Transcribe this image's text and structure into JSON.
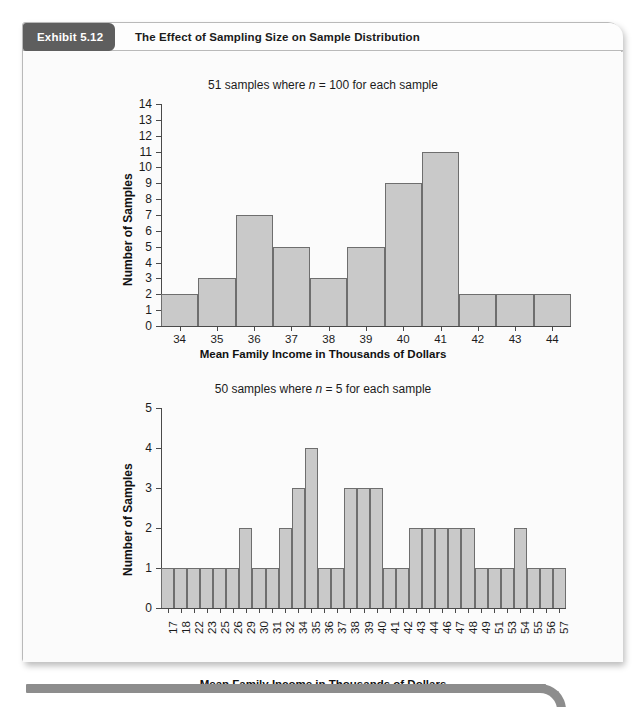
{
  "exhibit": {
    "tab_label": "Exhibit 5.12",
    "title": "The Effect of Sampling Size on Sample Distribution"
  },
  "colors": {
    "tab_background": "#5e5e5e",
    "bar_fill": "#c9c9c9",
    "bar_stroke": "#6e6e6e",
    "axis": "#4a4a4a",
    "card_background": "#fbfbfb",
    "rule": "#8d8d8d"
  },
  "chart_data": [
    {
      "id": "chart-top",
      "type": "bar",
      "title": "51 samples where n = 100 for each sample",
      "title_plain": "51 samples where ",
      "title_italic": "n",
      "title_rest": " = 100 for each sample",
      "xlabel": "Mean Family Income in Thousands of Dollars",
      "ylabel": "Number of Samples",
      "categories": [
        "34",
        "35",
        "36",
        "37",
        "38",
        "39",
        "40",
        "41",
        "42",
        "43",
        "44"
      ],
      "values": [
        2,
        3,
        7,
        5,
        3,
        5,
        9,
        11,
        2,
        2,
        2
      ],
      "ylim": [
        0,
        14
      ],
      "yticks": [
        0,
        1,
        2,
        3,
        4,
        5,
        6,
        7,
        8,
        9,
        10,
        11,
        12,
        13,
        14
      ],
      "grid": false,
      "legend": "none"
    },
    {
      "id": "chart-bottom",
      "type": "bar",
      "title": "50 samples where n = 5 for each sample",
      "title_plain": "50 samples where ",
      "title_italic": "n",
      "title_rest": " = 5 for each sample",
      "xlabel": "Mean Family Income in Thousands of Dollars",
      "ylabel": "Number of Samples",
      "categories": [
        "17",
        "18",
        "22",
        "23",
        "25",
        "26",
        "29",
        "30",
        "31",
        "32",
        "34",
        "35",
        "36",
        "37",
        "38",
        "39",
        "40",
        "41",
        "42",
        "43",
        "44",
        "46",
        "47",
        "48",
        "49",
        "51",
        "53",
        "54",
        "55",
        "56",
        "57"
      ],
      "values": [
        1,
        1,
        1,
        1,
        1,
        1,
        2,
        1,
        1,
        2,
        3,
        4,
        1,
        1,
        3,
        3,
        3,
        1,
        1,
        2,
        2,
        2,
        2,
        2,
        1,
        1,
        1,
        2,
        1,
        1,
        1
      ],
      "ylim": [
        0,
        5
      ],
      "yticks": [
        0,
        1,
        2,
        3,
        4,
        5
      ],
      "grid": false,
      "legend": "none"
    }
  ]
}
